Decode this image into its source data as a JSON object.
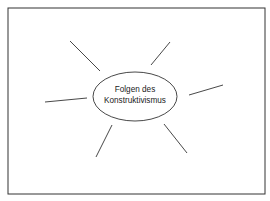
{
  "diagram": {
    "type": "mind-map",
    "center": {
      "line1": "Folgen des",
      "line2": "Konstruktivismus"
    },
    "branches": [
      {
        "id": "top-left",
        "label": ""
      },
      {
        "id": "top-right",
        "label": ""
      },
      {
        "id": "right",
        "label": ""
      },
      {
        "id": "left",
        "label": ""
      },
      {
        "id": "bottom-left",
        "label": ""
      },
      {
        "id": "bottom-right",
        "label": ""
      }
    ],
    "colors": {
      "stroke": "#333333",
      "background": "#ffffff"
    }
  }
}
